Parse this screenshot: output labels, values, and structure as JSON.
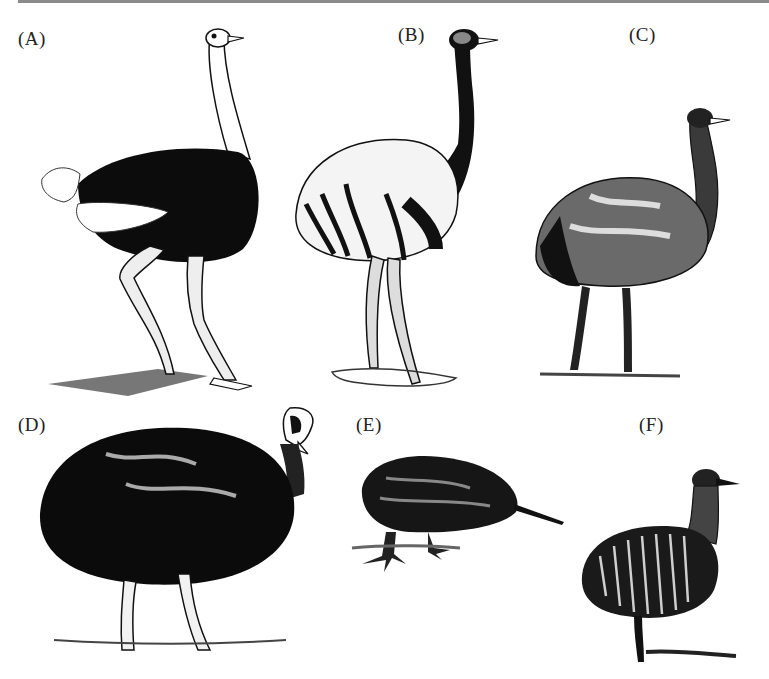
{
  "figure": {
    "panels": [
      {
        "label": "(A)",
        "subject": "ostrich"
      },
      {
        "label": "(B)",
        "subject": "rhea"
      },
      {
        "label": "(C)",
        "subject": "emu"
      },
      {
        "label": "(D)",
        "subject": "cassowary"
      },
      {
        "label": "(E)",
        "subject": "kiwi"
      },
      {
        "label": "(F)",
        "subject": "tinamou"
      }
    ]
  }
}
